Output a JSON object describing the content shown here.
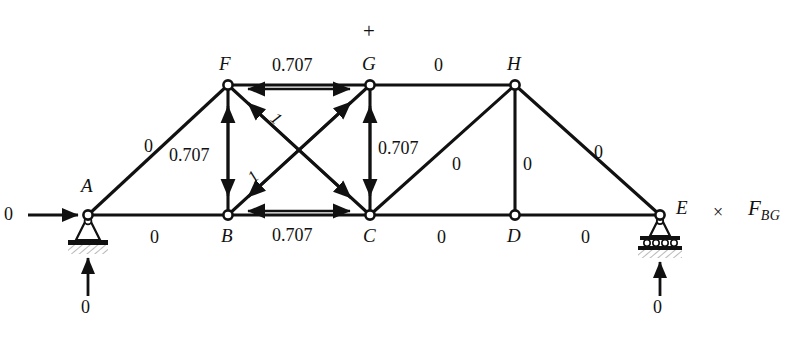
{
  "figure": {
    "type": "truss-force-diagram",
    "plus_sign": "+",
    "multiply_sign": "×",
    "target_force_base": "F",
    "target_force_sub": "BG"
  },
  "nodes": [
    {
      "id": "A",
      "label": "A",
      "x": 88,
      "y": 215,
      "support": "pin"
    },
    {
      "id": "B",
      "label": "B",
      "x": 228,
      "y": 215,
      "support": "none"
    },
    {
      "id": "C",
      "label": "C",
      "x": 370,
      "y": 215,
      "support": "none"
    },
    {
      "id": "D",
      "label": "D",
      "x": 515,
      "y": 215,
      "support": "none"
    },
    {
      "id": "E",
      "label": "E",
      "x": 660,
      "y": 215,
      "support": "roller"
    },
    {
      "id": "F",
      "label": "F",
      "x": 228,
      "y": 85,
      "support": "none"
    },
    {
      "id": "G",
      "label": "G",
      "x": 370,
      "y": 85,
      "support": "none"
    },
    {
      "id": "H",
      "label": "H",
      "x": 515,
      "y": 85,
      "support": "none"
    }
  ],
  "members": [
    {
      "id": "AF",
      "from": "A",
      "to": "F",
      "force": "0",
      "arrows": "none"
    },
    {
      "id": "FG",
      "from": "F",
      "to": "G",
      "force": "0.707",
      "arrows": "tension"
    },
    {
      "id": "GH",
      "from": "G",
      "to": "H",
      "force": "0",
      "arrows": "none"
    },
    {
      "id": "HE",
      "from": "H",
      "to": "E",
      "force": "0",
      "arrows": "none"
    },
    {
      "id": "AB",
      "from": "A",
      "to": "B",
      "force": "0",
      "arrows": "none"
    },
    {
      "id": "BC",
      "from": "B",
      "to": "C",
      "force": "0.707",
      "arrows": "tension"
    },
    {
      "id": "CD",
      "from": "C",
      "to": "D",
      "force": "0",
      "arrows": "none"
    },
    {
      "id": "DE",
      "from": "D",
      "to": "E",
      "force": "0",
      "arrows": "none"
    },
    {
      "id": "FB",
      "from": "F",
      "to": "B",
      "force": "0.707",
      "arrows": "compression"
    },
    {
      "id": "GC",
      "from": "G",
      "to": "C",
      "force": "0.707",
      "arrows": "compression"
    },
    {
      "id": "HD",
      "from": "H",
      "to": "D",
      "force": "0",
      "arrows": "none"
    },
    {
      "id": "FC",
      "from": "F",
      "to": "C",
      "force": "1",
      "arrows": "compression"
    },
    {
      "id": "BG",
      "from": "B",
      "to": "G",
      "force": "1",
      "arrows": "compression"
    },
    {
      "id": "CH",
      "from": "C",
      "to": "H",
      "force": "0",
      "arrows": "none"
    }
  ],
  "loads": {
    "horizontal_at_A": "0",
    "reaction_at_A": "0",
    "reaction_at_E": "0"
  },
  "labels": {
    "af_force": "0",
    "fb_force": "0.707",
    "fg_force": "0.707",
    "gh_force": "0",
    "he_force": "0",
    "ab_force": "0",
    "bc_force": "0.707",
    "cd_force": "0",
    "de_force": "0",
    "gc_force": "0.707",
    "ch_force": "0",
    "hd_force": "0",
    "fc_force": "1",
    "bg_force": "1",
    "node_a": "A",
    "node_b": "B",
    "node_c": "C",
    "node_d": "D",
    "node_e": "E",
    "node_f": "F",
    "node_g": "G",
    "node_h": "H",
    "load_left": "0",
    "reaction_left": "0",
    "reaction_right": "0",
    "plus": "+",
    "times": "×",
    "fbg_base": "F",
    "fbg_sub": "BG"
  },
  "colors": {
    "line": "#111111",
    "text": "#111111",
    "background": "#ffffff",
    "node_fill": "#ffffff"
  }
}
